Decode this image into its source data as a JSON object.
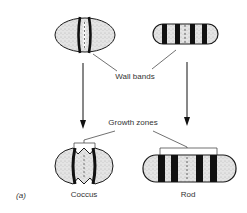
{
  "figure": {
    "panel_label": "(a)",
    "labels": {
      "wall_bands": "Wall bands",
      "growth_zones": "Growth zones",
      "coccus": "Coccus",
      "rod": "Rod"
    },
    "colors": {
      "fill": "#e6e6e6",
      "stroke": "#1a1a1a",
      "band": "#111111",
      "text": "#333333"
    },
    "shapes": [
      {
        "name": "coccus-before",
        "type": "coccus",
        "stage": "initial"
      },
      {
        "name": "rod-before",
        "type": "rod",
        "stage": "initial"
      },
      {
        "name": "coccus-after",
        "type": "coccus",
        "stage": "after growth"
      },
      {
        "name": "rod-after",
        "type": "rod",
        "stage": "after growth"
      }
    ]
  }
}
